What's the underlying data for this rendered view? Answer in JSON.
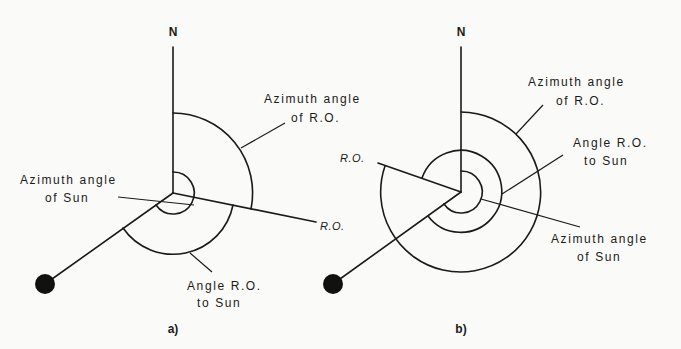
{
  "figure": {
    "panels": [
      {
        "id": "a",
        "caption": "a)",
        "north_label": "N",
        "ro_label": "R.O.",
        "labels": {
          "azimuth_ro_line1": "Azimuth angle",
          "azimuth_ro_line2": "of R.O.",
          "azimuth_sun_line1": "Azimuth angle",
          "azimuth_sun_line2": "of Sun",
          "angle_ro_sun_line1": "Angle R.O.",
          "angle_ro_sun_line2": "to Sun"
        }
      },
      {
        "id": "b",
        "caption": "b)",
        "north_label": "N",
        "ro_label": "R.O.",
        "labels": {
          "azimuth_ro_line1": "Azimuth angle",
          "azimuth_ro_line2": "of R.O.",
          "angle_ro_sun_line1": "Angle R.O.",
          "angle_ro_sun_line2": "to Sun",
          "azimuth_sun_line1": "Azimuth angle",
          "azimuth_sun_line2": "of Sun"
        }
      }
    ],
    "colors": {
      "ink": "#1a1a1a",
      "background": "#fafaf8"
    }
  }
}
